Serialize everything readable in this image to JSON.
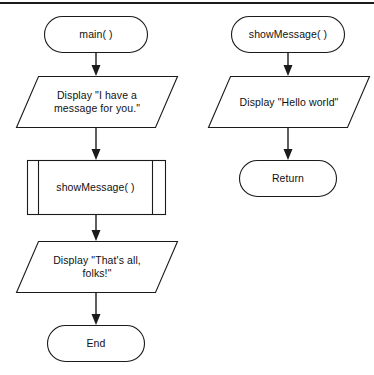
{
  "figure": {
    "type": "flowchart",
    "title": "",
    "has_top_rule": true,
    "background_color": "#ffffff",
    "stroke_color": "#1b1b1b",
    "text_color": "#111111"
  },
  "columns": [
    {
      "name": "main-function-flow",
      "nodes": [
        {
          "id": "main-start",
          "shape": "terminal",
          "label": "main( )"
        },
        {
          "id": "display-i-have-a-message",
          "shape": "parallelogram",
          "label": "Display \"I have a\nmessage for you.\""
        },
        {
          "id": "call-show-message",
          "shape": "subroutine",
          "label": "showMessage( )"
        },
        {
          "id": "display-thats-all-folks",
          "shape": "parallelogram",
          "label": "Display \"That's all,\nfolks!\""
        },
        {
          "id": "main-end",
          "shape": "terminal",
          "label": "End"
        }
      ]
    },
    {
      "name": "show-message-function-flow",
      "nodes": [
        {
          "id": "show-message-start",
          "shape": "terminal",
          "label": "showMessage( )"
        },
        {
          "id": "display-hello-world",
          "shape": "parallelogram",
          "label": "Display \"Hello world\""
        },
        {
          "id": "show-message-return",
          "shape": "terminal",
          "label": "Return"
        }
      ]
    }
  ],
  "connectors": [
    {
      "from": "main-start",
      "to": "display-i-have-a-message",
      "arrow": "down"
    },
    {
      "from": "display-i-have-a-message",
      "to": "call-show-message",
      "arrow": "down"
    },
    {
      "from": "call-show-message",
      "to": "display-thats-all-folks",
      "arrow": "down"
    },
    {
      "from": "display-thats-all-folks",
      "to": "main-end",
      "arrow": "down"
    },
    {
      "from": "show-message-start",
      "to": "display-hello-world",
      "arrow": "down"
    },
    {
      "from": "display-hello-world",
      "to": "show-message-return",
      "arrow": "down"
    }
  ]
}
